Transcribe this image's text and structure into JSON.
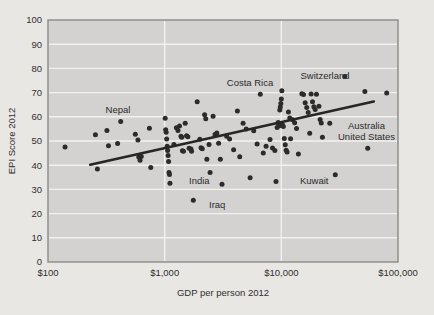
{
  "chart_data": {
    "type": "scatter",
    "title": "",
    "xlabel": "GDP per person 2012",
    "ylabel": "EPI Score 2012",
    "xscale": "log",
    "yscale": "linear",
    "xlim": [
      100,
      100000
    ],
    "ylim": [
      0,
      100
    ],
    "grid": true,
    "legend": null,
    "xticks": [
      100,
      1000,
      10000,
      100000
    ],
    "xtick_labels": [
      "$100",
      "$1,000",
      "$10,000",
      "$100,000"
    ],
    "yticks": [
      0,
      10,
      20,
      30,
      40,
      50,
      60,
      70,
      80,
      90,
      100
    ],
    "ytick_labels": [
      "0",
      "10",
      "20",
      "30",
      "40",
      "50",
      "60",
      "70",
      "80",
      "90",
      "100"
    ],
    "plot_bg_color": "#d3d2d0",
    "grid_color": "#f2f1ef",
    "point_color": "#2b2b2b",
    "trendline_color": "#262626",
    "trendline": {
      "x": [
        230,
        62000
      ],
      "y": [
        40.2,
        66.3
      ]
    },
    "points": [
      {
        "x": 140,
        "y": 47.5
      },
      {
        "x": 255,
        "y": 52.6
      },
      {
        "x": 265,
        "y": 38.4
      },
      {
        "x": 320,
        "y": 54.3
      },
      {
        "x": 330,
        "y": 48.0
      },
      {
        "x": 395,
        "y": 49.0
      },
      {
        "x": 420,
        "y": 58.1
      },
      {
        "x": 560,
        "y": 52.8
      },
      {
        "x": 590,
        "y": 50.4
      },
      {
        "x": 600,
        "y": 43.4
      },
      {
        "x": 615,
        "y": 42.0
      },
      {
        "x": 630,
        "y": 43.6
      },
      {
        "x": 740,
        "y": 55.3
      },
      {
        "x": 760,
        "y": 39.0
      },
      {
        "x": 1010,
        "y": 59.4
      },
      {
        "x": 1020,
        "y": 54.7
      },
      {
        "x": 1030,
        "y": 53.6
      },
      {
        "x": 1040,
        "y": 50.8
      },
      {
        "x": 1050,
        "y": 47.8
      },
      {
        "x": 1060,
        "y": 46.1
      },
      {
        "x": 1070,
        "y": 44.0
      },
      {
        "x": 1080,
        "y": 41.5
      },
      {
        "x": 1090,
        "y": 37.0
      },
      {
        "x": 1100,
        "y": 36.2
      },
      {
        "x": 1110,
        "y": 32.5
      },
      {
        "x": 1200,
        "y": 48.6
      },
      {
        "x": 1260,
        "y": 55.5
      },
      {
        "x": 1300,
        "y": 54.3
      },
      {
        "x": 1340,
        "y": 56.2
      },
      {
        "x": 1380,
        "y": 52.0
      },
      {
        "x": 1400,
        "y": 51.5
      },
      {
        "x": 1420,
        "y": 46.0
      },
      {
        "x": 1450,
        "y": 45.8
      },
      {
        "x": 1500,
        "y": 57.3
      },
      {
        "x": 1540,
        "y": 52.2
      },
      {
        "x": 1580,
        "y": 51.8
      },
      {
        "x": 1620,
        "y": 47.0
      },
      {
        "x": 1680,
        "y": 46.7
      },
      {
        "x": 1700,
        "y": 45.8
      },
      {
        "x": 1760,
        "y": 25.5
      },
      {
        "x": 1900,
        "y": 66.2
      },
      {
        "x": 2000,
        "y": 50.7
      },
      {
        "x": 2050,
        "y": 47.2
      },
      {
        "x": 2100,
        "y": 46.8
      },
      {
        "x": 2200,
        "y": 60.8
      },
      {
        "x": 2250,
        "y": 59.2
      },
      {
        "x": 2300,
        "y": 42.5
      },
      {
        "x": 2400,
        "y": 48.6
      },
      {
        "x": 2450,
        "y": 37.0
      },
      {
        "x": 2600,
        "y": 60.2
      },
      {
        "x": 2700,
        "y": 52.7
      },
      {
        "x": 2800,
        "y": 53.3
      },
      {
        "x": 2900,
        "y": 49.1
      },
      {
        "x": 3000,
        "y": 42.5
      },
      {
        "x": 3100,
        "y": 32.1
      },
      {
        "x": 3400,
        "y": 52.0
      },
      {
        "x": 3600,
        "y": 50.8
      },
      {
        "x": 3900,
        "y": 46.4
      },
      {
        "x": 4200,
        "y": 62.4
      },
      {
        "x": 4400,
        "y": 43.5
      },
      {
        "x": 4700,
        "y": 57.3
      },
      {
        "x": 5000,
        "y": 55.0
      },
      {
        "x": 5400,
        "y": 34.8
      },
      {
        "x": 5800,
        "y": 54.2
      },
      {
        "x": 6200,
        "y": 48.8
      },
      {
        "x": 6600,
        "y": 69.3
      },
      {
        "x": 7000,
        "y": 45.0
      },
      {
        "x": 7400,
        "y": 47.8
      },
      {
        "x": 8000,
        "y": 50.6
      },
      {
        "x": 8400,
        "y": 47.1
      },
      {
        "x": 8800,
        "y": 46.1
      },
      {
        "x": 9000,
        "y": 33.3
      },
      {
        "x": 9200,
        "y": 55.6
      },
      {
        "x": 9400,
        "y": 57.6
      },
      {
        "x": 9500,
        "y": 57.0
      },
      {
        "x": 9600,
        "y": 56.3
      },
      {
        "x": 9700,
        "y": 62.8
      },
      {
        "x": 9800,
        "y": 64.0
      },
      {
        "x": 9900,
        "y": 65.5
      },
      {
        "x": 10000,
        "y": 67.4
      },
      {
        "x": 10100,
        "y": 70.8
      },
      {
        "x": 10200,
        "y": 56.8
      },
      {
        "x": 10400,
        "y": 56.0
      },
      {
        "x": 10600,
        "y": 51.0
      },
      {
        "x": 10800,
        "y": 48.4
      },
      {
        "x": 11000,
        "y": 46.2
      },
      {
        "x": 11200,
        "y": 45.5
      },
      {
        "x": 11500,
        "y": 62.0
      },
      {
        "x": 11800,
        "y": 59.5
      },
      {
        "x": 12000,
        "y": 50.9
      },
      {
        "x": 12500,
        "y": 58.8
      },
      {
        "x": 13000,
        "y": 57.5
      },
      {
        "x": 13500,
        "y": 55.2
      },
      {
        "x": 14000,
        "y": 44.6
      },
      {
        "x": 15000,
        "y": 69.5
      },
      {
        "x": 15500,
        "y": 69.2
      },
      {
        "x": 16000,
        "y": 65.8
      },
      {
        "x": 16500,
        "y": 63.8
      },
      {
        "x": 17000,
        "y": 61.8
      },
      {
        "x": 17500,
        "y": 53.2
      },
      {
        "x": 18000,
        "y": 69.4
      },
      {
        "x": 18500,
        "y": 66.2
      },
      {
        "x": 19000,
        "y": 64.2
      },
      {
        "x": 19500,
        "y": 63.0
      },
      {
        "x": 20000,
        "y": 69.3
      },
      {
        "x": 21000,
        "y": 64.4
      },
      {
        "x": 21500,
        "y": 58.9
      },
      {
        "x": 22000,
        "y": 57.4
      },
      {
        "x": 22500,
        "y": 51.5
      },
      {
        "x": 26000,
        "y": 57.3
      },
      {
        "x": 29000,
        "y": 36.1
      },
      {
        "x": 35000,
        "y": 76.7
      },
      {
        "x": 52000,
        "y": 70.5
      },
      {
        "x": 55000,
        "y": 47.0
      },
      {
        "x": 80000,
        "y": 69.8
      }
    ],
    "annotations": [
      {
        "label": "Nepal",
        "x_px": 118,
        "y_px": 113,
        "anchor": "middle"
      },
      {
        "label": "Costa Rica",
        "x_px": 250,
        "y_px": 86,
        "anchor": "middle"
      },
      {
        "label": "Switzerland",
        "x_px": 325,
        "y_px": 79,
        "anchor": "middle"
      },
      {
        "label": "Australia",
        "x_px": 348,
        "y_px": 129,
        "anchor": "start"
      },
      {
        "label": "United States",
        "x_px": 338,
        "y_px": 140,
        "anchor": "start"
      },
      {
        "label": "India",
        "x_px": 189,
        "y_px": 184,
        "anchor": "start"
      },
      {
        "label": "Iraq",
        "x_px": 209,
        "y_px": 208,
        "anchor": "start"
      },
      {
        "label": "Kuwait",
        "x_px": 300,
        "y_px": 184,
        "anchor": "start"
      }
    ]
  },
  "figure": {
    "xlabel": "GDP per person 2012",
    "ylabel": "EPI Score 2012",
    "xtick_0": "$100",
    "xtick_1": "$1,000",
    "xtick_2": "$10,000",
    "xtick_3": "$100,000",
    "ytick_0": "0",
    "ytick_10": "10",
    "ytick_20": "20",
    "ytick_30": "30",
    "ytick_40": "40",
    "ytick_50": "50",
    "ytick_60": "60",
    "ytick_70": "70",
    "ytick_80": "80",
    "ytick_90": "90",
    "ytick_100": "100",
    "label_nepal": "Nepal",
    "label_costa_rica": "Costa Rica",
    "label_switzerland": "Switzerland",
    "label_australia": "Australia",
    "label_united_states": "United States",
    "label_india": "India",
    "label_iraq": "Iraq",
    "label_kuwait": "Kuwait"
  }
}
